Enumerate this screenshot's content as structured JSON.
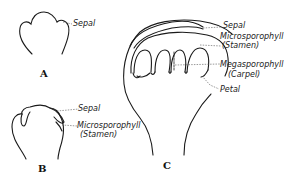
{
  "figures": [
    {
      "id": "A",
      "letter": "A",
      "labels": [
        {
          "key": "sepal",
          "text": "Sepal"
        }
      ]
    },
    {
      "id": "B",
      "letter": "B",
      "labels": [
        {
          "key": "sepal",
          "text": "Sepal"
        },
        {
          "key": "microsporophyll",
          "text": "Microsporophyll"
        },
        {
          "key": "stamen",
          "text": "(Stamen)"
        }
      ]
    },
    {
      "id": "C",
      "letter": "C",
      "labels": [
        {
          "key": "sepal",
          "text": "Sepal"
        },
        {
          "key": "microsporophyll",
          "text": "Microsporophyll"
        },
        {
          "key": "stamen",
          "text": "(Stamen)"
        },
        {
          "key": "megasporophyll",
          "text": "Megasporophyll"
        },
        {
          "key": "carpel",
          "text": "(Carpel)"
        },
        {
          "key": "petal",
          "text": "Petal"
        }
      ]
    }
  ],
  "colors": {
    "line": "#1a1a1a",
    "leader": "#444444",
    "background": "#ffffff"
  }
}
